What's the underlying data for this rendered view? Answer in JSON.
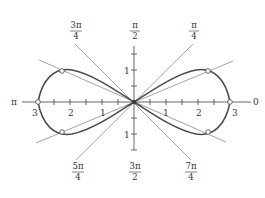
{
  "figure": {
    "type": "polar-graph",
    "curve": "lemniscate",
    "colors": {
      "curve": "#4a4a4a",
      "axis": "#555555",
      "rays": "#8a8a8a",
      "text": "#333333",
      "background": "#ffffff"
    }
  },
  "angle_labels": {
    "a3pi4": {
      "num": "3π",
      "den": "4"
    },
    "api2": {
      "num": "π",
      "den": "2"
    },
    "api4": {
      "num": "π",
      "den": "4"
    },
    "a5pi4": {
      "num": "5π",
      "den": "4"
    },
    "a3pi2": {
      "num": "3π",
      "den": "2"
    },
    "a7pi4": {
      "num": "7π",
      "den": "4"
    },
    "pi": "π",
    "zero": "0"
  },
  "axis_labels": {
    "x_left": [
      "3",
      "2",
      "1"
    ],
    "x_right": [
      "1",
      "2",
      "3"
    ],
    "y_up": "1",
    "y_down": "1"
  }
}
